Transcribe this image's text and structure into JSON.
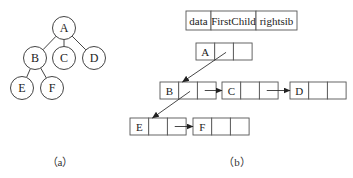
{
  "tree": {
    "nodes": [
      {
        "id": "A",
        "label": "A"
      },
      {
        "id": "B",
        "label": "B"
      },
      {
        "id": "C",
        "label": "C"
      },
      {
        "id": "D",
        "label": "D"
      },
      {
        "id": "E",
        "label": "E"
      },
      {
        "id": "F",
        "label": "F"
      }
    ],
    "edges": [
      {
        "from": "A",
        "to": "B"
      },
      {
        "from": "A",
        "to": "C"
      },
      {
        "from": "A",
        "to": "D"
      },
      {
        "from": "B",
        "to": "E"
      },
      {
        "from": "B",
        "to": "F"
      }
    ],
    "caption": "（a）"
  },
  "list": {
    "header": {
      "fields": [
        "data",
        "FirstChild",
        "rightsib"
      ]
    },
    "records": [
      {
        "id": "A",
        "data": "A",
        "firstChild": "B",
        "rightSib": null
      },
      {
        "id": "B",
        "data": "B",
        "firstChild": "E",
        "rightSib": "C"
      },
      {
        "id": "C",
        "data": "C",
        "firstChild": null,
        "rightSib": "D"
      },
      {
        "id": "D",
        "data": "D",
        "firstChild": null,
        "rightSib": null
      },
      {
        "id": "E",
        "data": "E",
        "firstChild": null,
        "rightSib": "F"
      },
      {
        "id": "F",
        "data": "F",
        "firstChild": null,
        "rightSib": null
      }
    ],
    "caption": "（b）"
  },
  "colors": {
    "stroke": "#444444",
    "text": "#222222",
    "background": "#ffffff"
  }
}
